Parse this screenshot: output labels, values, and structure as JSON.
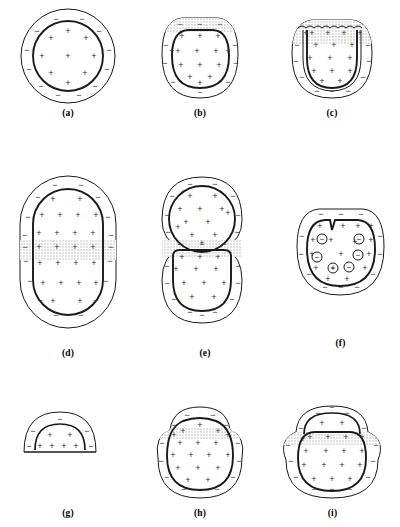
{
  "figure": {
    "background_color": "#ffffff",
    "line_color": "#1a1a1a",
    "stipple_color": "#c8c8c8",
    "charge_color": "#2b2b2b",
    "symbols": {
      "positive": "+",
      "negative": "−",
      "vesicle_negative": "⊖"
    }
  },
  "panels": [
    {
      "id": "a",
      "label": "(a)",
      "shape": "circle",
      "description": "Resting spherical cell: thick inner membrane ring bearing interior positive charges, thin outer contour bearing exterior negative charges",
      "inner_charge": "+",
      "outer_charge": "−",
      "inner_charge_count": 9,
      "outer_charge_count": 12,
      "stipple_band": "none",
      "vesicles": 0
    },
    {
      "id": "b",
      "label": "(b)",
      "shape": "flat-topped-round",
      "description": "Cell flattened at the apex with a shallow stippled band hugging the top of the membrane",
      "inner_charge": "+",
      "outer_charge": "−",
      "inner_charge_count": 14,
      "outer_charge_count": 10,
      "stipple_band": "apex-shallow",
      "vesicles": 0
    },
    {
      "id": "c",
      "label": "(c)",
      "shape": "flat-topped-round",
      "description": "Stippled region penetrates deeper into the apex; the upper membrane is crinkled and the membrane folds inward at both shoulders",
      "inner_charge": "+",
      "outer_charge": "−",
      "inner_charge_count": 16,
      "outer_charge_count": 9,
      "stipple_band": "apex-deep-wavy",
      "vesicles": 0
    },
    {
      "id": "d",
      "label": "(d)",
      "shape": "elongated-oval",
      "description": "Elongated cell with a horizontal stippled band crossing the equator from edge to edge",
      "inner_charge": "+",
      "outer_charge": "−",
      "inner_charge_count": 20,
      "outer_charge_count": 14,
      "stipple_band": "equatorial",
      "vesicles": 0
    },
    {
      "id": "e",
      "label": "(e)",
      "shape": "figure-eight",
      "description": "Cell constricted into two lobes; the stippled band occupies the cleavage furrow between daughter cells",
      "inner_charge": "+",
      "outer_charge": "−",
      "inner_charge_count": 24,
      "outer_charge_count": 20,
      "stipple_band": "furrow",
      "vesicles": 0
    },
    {
      "id": "f",
      "label": "(f)",
      "shape": "notched-round",
      "description": "Rounded cell with a narrow inward notch at the apex and circled negative vesicles distributed through the cytoplasm",
      "inner_charge": "+",
      "outer_charge": "−",
      "inner_charge_count": 16,
      "outer_charge_count": 12,
      "stipple_band": "none",
      "vesicles": 6,
      "vesicle_symbol": "⊖"
    },
    {
      "id": "g",
      "label": "(g)",
      "shape": "dome",
      "description": "Small dome-shaped fragment with an internal arc; positive charges line the interior beneath the arc and negative charges the exterior",
      "inner_charge": "+",
      "outer_charge": "−",
      "inner_charge_count": 8,
      "outer_charge_count": 5,
      "stipple_band": "none",
      "vesicles": 0
    },
    {
      "id": "h",
      "label": "(h)",
      "shape": "bumped-round",
      "description": "Round cell carrying a bump at the apex with a thin stippled band separating bump from cell body",
      "inner_charge": "+",
      "outer_charge": "−",
      "inner_charge_count": 17,
      "outer_charge_count": 13,
      "stipple_band": "below-apex",
      "vesicles": 0
    },
    {
      "id": "i",
      "label": "(i)",
      "shape": "bumped-round-arc",
      "description": "Round cell with an enlarged apical bump containing an internal arc and positive charges; a stippled band crosses beneath the bump and lateral lobes flank the cell",
      "inner_charge": "+",
      "outer_charge": "−",
      "inner_charge_count": 18,
      "outer_charge_count": 14,
      "stipple_band": "below-apex",
      "vesicles": 0
    }
  ]
}
